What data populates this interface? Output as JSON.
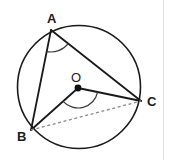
{
  "figure": {
    "background_color": "#ffffff",
    "stroke_color": "#1a1a1a",
    "divider_color": "#e3e3e3",
    "circle": {
      "name": "circumscribed-circle",
      "cx": 79,
      "cy": 87,
      "r": 61.5,
      "stroke_width": 1.6
    },
    "points": {
      "A": {
        "label": "A",
        "x": 51,
        "y": 30,
        "label_x": 47,
        "label_y": 23
      },
      "B": {
        "label": "B",
        "x": 31,
        "y": 130,
        "label_x": 17,
        "label_y": 141
      },
      "C": {
        "label": "C",
        "x": 141,
        "y": 101,
        "label_x": 147,
        "label_y": 106
      },
      "O": {
        "label": "O",
        "x": 78,
        "y": 88,
        "label_x": 71,
        "label_y": 82,
        "dot_radius": 3.4
      }
    },
    "segments": [
      {
        "name": "segment-AB",
        "from": "A",
        "to": "B",
        "style": "solid"
      },
      {
        "name": "segment-AC",
        "from": "A",
        "to": "C",
        "style": "solid"
      },
      {
        "name": "segment-OB",
        "from": "O",
        "to": "B",
        "style": "solid"
      },
      {
        "name": "segment-OC",
        "from": "O",
        "to": "C",
        "style": "solid"
      },
      {
        "name": "segment-BC",
        "from": "B",
        "to": "C",
        "style": "dashed"
      }
    ],
    "angle_arcs": [
      {
        "name": "inscribed-angle-BAC",
        "vertex": "A",
        "radius": 22
      },
      {
        "name": "central-angle-BOC",
        "vertex": "O",
        "radius": 20
      }
    ]
  }
}
